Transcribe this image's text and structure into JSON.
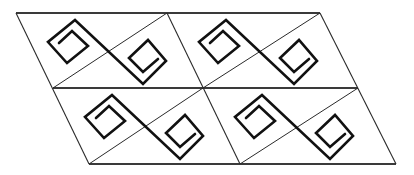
{
  "figure": {
    "colors": {
      "background": "#ffffff",
      "lines": "#2a2a2a",
      "motif": "#111111"
    },
    "grid": {
      "rows": 2,
      "cols": 2,
      "vertices": [
        [
          [
            16,
            13
          ],
          [
            167,
            13
          ],
          [
            320,
            13
          ]
        ],
        [
          [
            53,
            88
          ],
          [
            203,
            88
          ],
          [
            358,
            88
          ]
        ],
        [
          [
            89,
            164
          ],
          [
            240,
            164
          ],
          [
            396,
            164
          ]
        ]
      ]
    },
    "motif_path": [
      [
        59,
        43
      ],
      [
        72,
        31
      ],
      [
        88,
        46
      ],
      [
        67,
        63
      ],
      [
        48,
        42
      ],
      [
        75,
        20
      ],
      [
        143,
        84
      ],
      [
        166,
        61
      ],
      [
        148,
        40
      ],
      [
        129,
        58
      ],
      [
        143,
        72
      ],
      [
        158,
        59
      ]
    ],
    "cells": [
      {
        "name": "cell-r1-c1",
        "offset": [
          0,
          0
        ]
      },
      {
        "name": "cell-r1-c2",
        "offset": [
          151,
          0
        ]
      },
      {
        "name": "cell-r2-c1",
        "offset": [
          37,
          75
        ]
      },
      {
        "name": "cell-r2-c2",
        "offset": [
          187,
          75
        ]
      }
    ]
  }
}
